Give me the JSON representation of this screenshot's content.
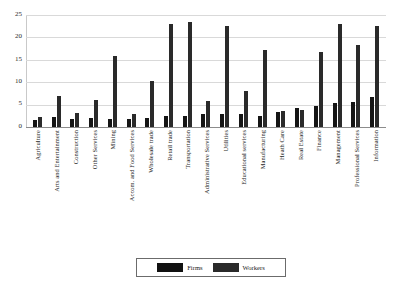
{
  "chart_data": {
    "type": "bar",
    "title": "",
    "subtitle": "",
    "xlabel": "",
    "ylabel": "",
    "ylim": [
      0,
      25
    ],
    "yticks": [
      0,
      5,
      10,
      15,
      20,
      25
    ],
    "grid": true,
    "legend_position": "bottom",
    "categories": [
      "Agriculture",
      "Arts and Entertainment",
      "Construction",
      "Other Services",
      "Mining",
      "Accom. and Food Services",
      "Wholesale trade",
      "Retail trade",
      "Transportation",
      "Administrative Services",
      "Utilities",
      "Educational services",
      "Manufacturing",
      "Heath Care",
      "Real Estate",
      "Finance",
      "Management",
      "Professional Services",
      "Information"
    ],
    "series": [
      {
        "name": "Firms",
        "color": "#151515",
        "values": [
          1.6,
          2.3,
          1.9,
          2.1,
          1.7,
          1.9,
          2.0,
          2.4,
          2.4,
          2.8,
          2.8,
          2.9,
          2.5,
          3.3,
          4.3,
          4.7,
          5.4,
          5.6,
          6.8
        ]
      },
      {
        "name": "Workers",
        "color": "#2a2a2a",
        "values": [
          2.2,
          6.9,
          3.2,
          6.1,
          15.9,
          3.0,
          10.3,
          22.9,
          23.5,
          5.9,
          22.6,
          8.1,
          17.2,
          3.5,
          3.7,
          16.8,
          22.9,
          18.2,
          22.5
        ]
      }
    ]
  },
  "legend": {
    "entries": [
      {
        "label": "Firms",
        "swatch": "firms-swatch"
      },
      {
        "label": "Workers",
        "swatch": "workers-swatch"
      }
    ]
  },
  "colors": {
    "firms": "#151515",
    "workers": "#2a2a2a",
    "gridline": "#d9d9d9",
    "axis": "#8c8c8c",
    "background": "#ffffff"
  }
}
